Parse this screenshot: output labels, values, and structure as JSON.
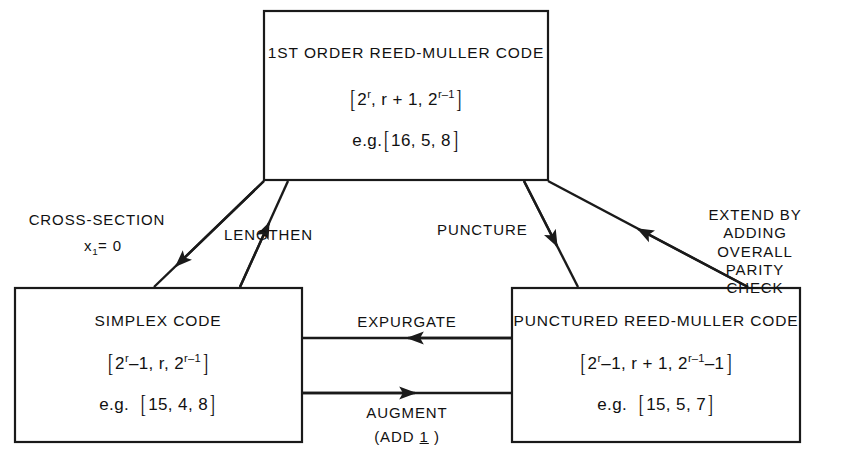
{
  "diagram": {
    "ink_color": "#1a1a1a",
    "background_color": "#ffffff"
  },
  "boxes": {
    "top": {
      "name": "1ST ORDER REED-MULLER CODE",
      "params_prefix": "2",
      "params_full": "[ 2^r , r + 1 , 2^(r-1) ]",
      "params_parts": {
        "open": "[",
        "a_base": "2",
        "a_exp": "r",
        "mid": ", r + 1, ",
        "c_base": "2",
        "c_exp": "r–1",
        "close": "]"
      },
      "example_label": "e.g.",
      "example": "[ 16, 5, 8 ]",
      "example_parts": {
        "open": "[",
        "values": "16, 5, 8",
        "close": "]"
      }
    },
    "bottom_left": {
      "name": "SIMPLEX CODE",
      "params_full": "[ 2^r - 1 , r , 2^(r-1) ]",
      "params_parts": {
        "open": "[",
        "a_base": "2",
        "a_exp": "r",
        "a_suffix": "–1",
        "mid": ", r, ",
        "c_base": "2",
        "c_exp": "r–1",
        "close": "]"
      },
      "example_label": "e.g.",
      "example": "[ 15, 4, 8 ]",
      "example_parts": {
        "open": "[",
        "values": "15, 4, 8",
        "close": "]"
      }
    },
    "bottom_right": {
      "name": "PUNCTURED REED-MULLER CODE",
      "params_full": "[ 2^r - 1 , r + 1 , 2^(r-1) - 1 ]",
      "params_parts": {
        "open": "[",
        "a_base": "2",
        "a_exp": "r",
        "a_suffix": "–1",
        "mid": ", r + 1, ",
        "c_base": "2",
        "c_exp": "r–1",
        "c_suffix": "–1",
        "close": "]"
      },
      "example_label": "e.g.",
      "example": "[ 15, 5, 7 ]",
      "example_parts": {
        "open": "[",
        "values": "15, 5, 7",
        "close": "]"
      }
    }
  },
  "edges": {
    "cross_section": {
      "label_line1": "CROSS-SECTION",
      "label_line2_var": "x",
      "label_line2_sub": "1",
      "label_line2_rest": "= 0",
      "from": "1ST ORDER REED-MULLER CODE",
      "to": "SIMPLEX CODE",
      "direction": "down-left"
    },
    "lengthen": {
      "label": "LENGTHEN",
      "from": "SIMPLEX CODE",
      "to": "1ST ORDER REED-MULLER CODE",
      "direction": "up-right"
    },
    "puncture": {
      "label": "PUNCTURE",
      "from": "1ST ORDER REED-MULLER CODE",
      "to": "PUNCTURED REED-MULLER CODE",
      "direction": "down-right"
    },
    "extend": {
      "label": "EXTEND BY\nADDING OVERALL\nPARITY CHECK",
      "from": "PUNCTURED REED-MULLER CODE",
      "to": "1ST ORDER REED-MULLER CODE",
      "direction": "up-left"
    },
    "expurgate": {
      "label": "EXPURGATE",
      "from": "PUNCTURED REED-MULLER CODE",
      "to": "SIMPLEX CODE",
      "direction": "left"
    },
    "augment": {
      "label": "AUGMENT",
      "sublabel_prefix": "(ADD ",
      "sublabel_emph": "1",
      "sublabel_suffix": " )",
      "from": "SIMPLEX CODE",
      "to": "PUNCTURED REED-MULLER CODE",
      "direction": "right"
    }
  }
}
